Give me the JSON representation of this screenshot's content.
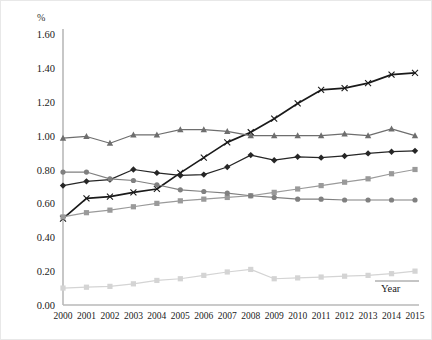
{
  "chart_data": {
    "type": "line",
    "title": "",
    "subtitle": "",
    "xlabel": "Year",
    "ylabel": "%",
    "unit_label": "%",
    "x": [
      2000,
      2001,
      2002,
      2003,
      2004,
      2005,
      2006,
      2007,
      2008,
      2009,
      2010,
      2011,
      2012,
      2013,
      2014,
      2015
    ],
    "categories": [
      "2000",
      "2001",
      "2002",
      "2003",
      "2004",
      "2005",
      "2006",
      "2007",
      "2008",
      "2009",
      "2010",
      "2011",
      "2012",
      "2013",
      "2014",
      "2015"
    ],
    "xlim": [
      2000,
      2015
    ],
    "ylim": [
      0.0,
      1.6
    ],
    "ytick_labels": [
      "0.00",
      "0.20",
      "0.40",
      "0.60",
      "0.80",
      "1.00",
      "1.20",
      "1.40",
      "1.60"
    ],
    "ytick_values": [
      0.0,
      0.2,
      0.4,
      0.6,
      0.8,
      1.0,
      1.2,
      1.4,
      1.6
    ],
    "ytick_step": 0.2,
    "grid": false,
    "legend": "none",
    "legend_position": "none",
    "series": [
      {
        "name": "series-x-black",
        "marker": "x",
        "color": "#1a1a1a",
        "values": [
          0.51,
          0.63,
          0.64,
          0.665,
          0.685,
          0.78,
          0.87,
          0.96,
          1.02,
          1.1,
          1.19,
          1.27,
          1.28,
          1.31,
          1.36,
          1.37
        ]
      },
      {
        "name": "series-triangle-gray",
        "marker": "triangle",
        "color": "#6e6e6e",
        "values": [
          0.985,
          0.995,
          0.955,
          1.005,
          1.005,
          1.035,
          1.035,
          1.025,
          1.0,
          1.0,
          1.0,
          1.0,
          1.01,
          1.0,
          1.04,
          1.0
        ]
      },
      {
        "name": "series-diamond-dark",
        "marker": "diamond",
        "color": "#262626",
        "values": [
          0.705,
          0.73,
          0.74,
          0.8,
          0.78,
          0.765,
          0.77,
          0.815,
          0.885,
          0.855,
          0.875,
          0.87,
          0.88,
          0.895,
          0.905,
          0.91
        ]
      },
      {
        "name": "series-square-midgray",
        "marker": "square",
        "color": "#9a9a9a",
        "values": [
          0.52,
          0.545,
          0.56,
          0.58,
          0.6,
          0.615,
          0.625,
          0.635,
          0.645,
          0.665,
          0.685,
          0.705,
          0.725,
          0.745,
          0.775,
          0.8
        ]
      },
      {
        "name": "series-circle-gray",
        "marker": "circle",
        "color": "#808080",
        "values": [
          0.785,
          0.785,
          0.745,
          0.735,
          0.71,
          0.68,
          0.67,
          0.66,
          0.645,
          0.635,
          0.625,
          0.625,
          0.62,
          0.62,
          0.62,
          0.62
        ]
      },
      {
        "name": "series-square-lightgray",
        "marker": "square",
        "color": "#d4d4d4",
        "values": [
          0.1,
          0.105,
          0.11,
          0.125,
          0.145,
          0.155,
          0.175,
          0.195,
          0.21,
          0.155,
          0.16,
          0.165,
          0.17,
          0.175,
          0.185,
          0.2
        ]
      }
    ]
  },
  "axis": {
    "y_unit": "%",
    "x_name": "Year"
  }
}
